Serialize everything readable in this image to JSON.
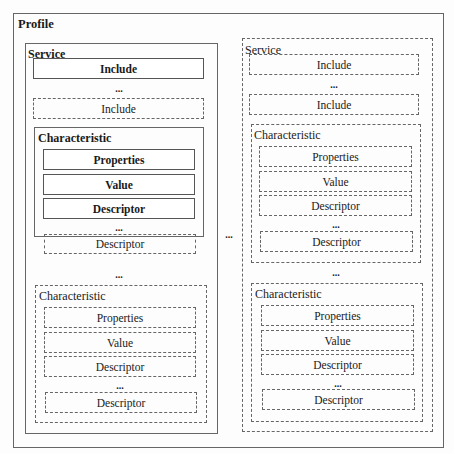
{
  "profile": {
    "label": "Profile"
  },
  "ellipsis": "...",
  "left_service": {
    "label": "Service",
    "includes": [
      {
        "label": "Include",
        "style": "solid"
      },
      {
        "label": "Include",
        "style": "dashed"
      }
    ],
    "characteristics": [
      {
        "label": "Characteristic",
        "style": "solid",
        "items": [
          {
            "label": "Properties",
            "style": "solid"
          },
          {
            "label": "Value",
            "style": "solid"
          },
          {
            "label": "Descriptor",
            "style": "solid"
          },
          {
            "label": "Descriptor",
            "style": "dashed"
          }
        ]
      },
      {
        "label": "Characteristic",
        "style": "dashed",
        "items": [
          {
            "label": "Properties",
            "style": "dashed"
          },
          {
            "label": "Value",
            "style": "dashed"
          },
          {
            "label": "Descriptor",
            "style": "dashed"
          },
          {
            "label": "Descriptor",
            "style": "dashed"
          }
        ]
      }
    ]
  },
  "right_service": {
    "label": "Service",
    "includes": [
      {
        "label": "Include",
        "style": "dashed"
      },
      {
        "label": "Include",
        "style": "dashed"
      }
    ],
    "characteristics": [
      {
        "label": "Characteristic",
        "style": "dashed",
        "items": [
          {
            "label": "Properties",
            "style": "dashed"
          },
          {
            "label": "Value",
            "style": "dashed"
          },
          {
            "label": "Descriptor",
            "style": "dashed"
          },
          {
            "label": "Descriptor",
            "style": "dashed"
          }
        ]
      },
      {
        "label": "Characteristic",
        "style": "dashed",
        "items": [
          {
            "label": "Properties",
            "style": "dashed"
          },
          {
            "label": "Value",
            "style": "dashed"
          },
          {
            "label": "Descriptor",
            "style": "dashed"
          },
          {
            "label": "Descriptor",
            "style": "dashed"
          }
        ]
      }
    ]
  }
}
